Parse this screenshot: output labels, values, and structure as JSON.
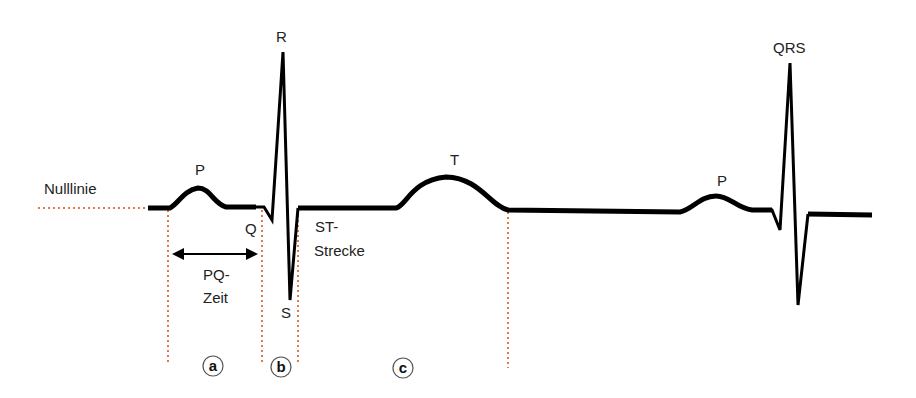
{
  "diagram": {
    "type": "ecg-waveform",
    "colors": {
      "trace": "#000000",
      "guide_dotted": "#e07a4a",
      "text": "#222222",
      "background": "#ffffff"
    },
    "labels": {
      "baseline": "Nulllinie",
      "p_wave_1": "P",
      "r_peak": "R",
      "q_point": "Q",
      "s_point": "S",
      "pq_line1": "PQ-",
      "pq_line2": "Zeit",
      "st_line1": "ST-",
      "st_line2": "Strecke",
      "t_wave": "T",
      "p_wave_2": "P",
      "qrs_complex": "QRS"
    },
    "intervals": [
      {
        "marker": "a",
        "meaning": "PQ-Zeit"
      },
      {
        "marker": "b",
        "meaning": "QRS"
      },
      {
        "marker": "c",
        "meaning": "ST-Strecke / T"
      }
    ]
  }
}
